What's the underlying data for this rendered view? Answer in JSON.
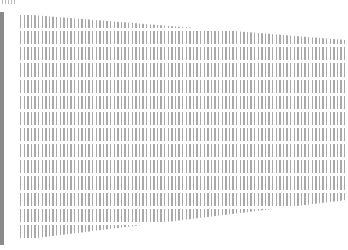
{
  "document": {
    "description": "Perspective-distorted scanned text page; content illegible",
    "text_lines_count": 14,
    "colors": {
      "ink": "#9a9a9a",
      "margin_bar": "#8a8a8a",
      "paper": "#ffffff"
    }
  }
}
